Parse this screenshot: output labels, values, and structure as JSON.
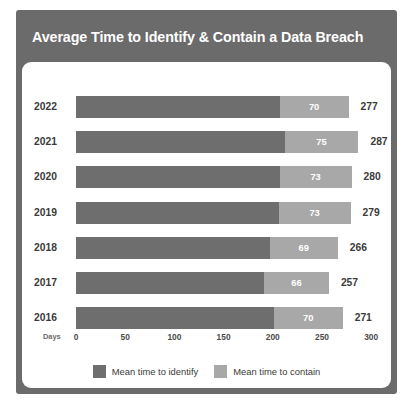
{
  "card": {
    "title": "Average Time to Identify & Contain a Data Breach",
    "header_color": "#6b6b6b",
    "panel_color": "#ffffff"
  },
  "chart_data": {
    "type": "bar",
    "orientation": "horizontal",
    "stacked": true,
    "title": "Average Time to Identify & Contain a Data Breach",
    "xlabel": "Days",
    "ylabel": "",
    "xlim": [
      0,
      300
    ],
    "xticks": [
      0,
      50,
      100,
      150,
      200,
      250,
      300
    ],
    "xtick_labels": [
      "0",
      "50",
      "100",
      "150",
      "200",
      "250",
      "300"
    ],
    "grid": false,
    "legend_position": "bottom",
    "categories": [
      "2022",
      "2021",
      "2020",
      "2019",
      "2018",
      "2017",
      "2016"
    ],
    "series": [
      {
        "name": "Mean time to identify",
        "color": "#6e6e6e",
        "values": [
          207,
          212,
          207,
          206,
          197,
          191,
          201
        ]
      },
      {
        "name": "Mean time to contain",
        "color": "#a8a8a8",
        "values": [
          70,
          75,
          73,
          73,
          69,
          66,
          70
        ]
      }
    ],
    "totals": [
      277,
      287,
      280,
      279,
      266,
      257,
      271
    ],
    "rows": [
      {
        "year": "2022",
        "identify": 207,
        "contain": 70,
        "contain_label": "70",
        "total": 277,
        "total_label": "277"
      },
      {
        "year": "2021",
        "identify": 212,
        "contain": 75,
        "contain_label": "75",
        "total": 287,
        "total_label": "287"
      },
      {
        "year": "2020",
        "identify": 207,
        "contain": 73,
        "contain_label": "73",
        "total": 280,
        "total_label": "280"
      },
      {
        "year": "2019",
        "identify": 206,
        "contain": 73,
        "contain_label": "73",
        "total": 279,
        "total_label": "279"
      },
      {
        "year": "2018",
        "identify": 197,
        "contain": 69,
        "contain_label": "69",
        "total": 266,
        "total_label": "266"
      },
      {
        "year": "2017",
        "identify": 191,
        "contain": 66,
        "contain_label": "66",
        "total": 257,
        "total_label": "257"
      },
      {
        "year": "2016",
        "identify": 201,
        "contain": 70,
        "contain_label": "70",
        "total": 271,
        "total_label": "271"
      }
    ],
    "legend": [
      {
        "label": "Mean time to identify",
        "color": "#6e6e6e",
        "swatch": "identify"
      },
      {
        "label": "Mean time to contain",
        "color": "#a8a8a8",
        "swatch": "contain"
      }
    ]
  }
}
